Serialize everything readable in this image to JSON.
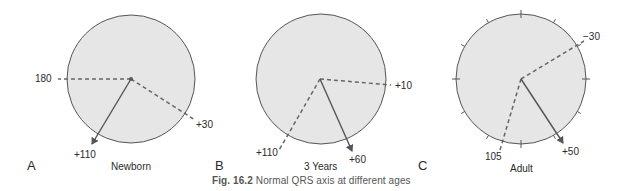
{
  "figure": {
    "caption_number": "Fig. 16.2",
    "caption_text": "Normal QRS axis at different ages",
    "colors": {
      "circle_fill": "#e6e6e6",
      "circle_stroke": "#555555",
      "axis_line": "#555555",
      "text": "#2a2a2a",
      "caption": "#555555"
    },
    "panels": [
      {
        "letter": "A",
        "title": "Newborn",
        "range_labels": [
          "180",
          "+30"
        ],
        "mean_axis_label": "+110",
        "has_degree_ticks": false
      },
      {
        "letter": "B",
        "title": "3 Years",
        "range_labels": [
          "+10",
          "+110"
        ],
        "mean_axis_label": "+60",
        "has_degree_ticks": false
      },
      {
        "letter": "C",
        "title": "Adult",
        "range_labels": [
          "−30",
          "105"
        ],
        "mean_axis_label": "+50",
        "has_degree_ticks": true
      }
    ]
  }
}
